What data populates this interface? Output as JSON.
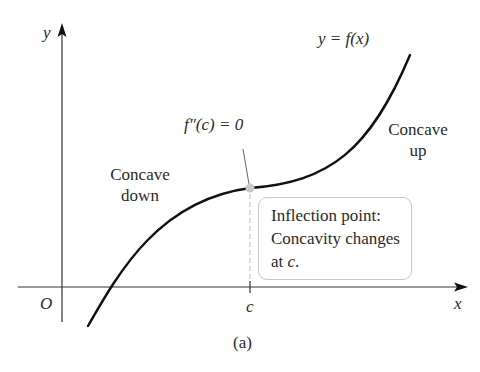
{
  "figure": {
    "axes": {
      "x_label": "x",
      "y_label": "y",
      "origin_label": "O",
      "tick_label_c": "c"
    },
    "curve_label": "y = f(x)",
    "annotations": {
      "second_derivative": "f″(c) = 0",
      "concave_down_line1": "Concave",
      "concave_down_line2": "down",
      "concave_up_line1": "Concave",
      "concave_up_line2": "up"
    },
    "callout_box": {
      "line1": "Inflection point:",
      "line2": "Concavity changes",
      "line3_prefix": "at ",
      "line3_var": "c",
      "line3_suffix": "."
    },
    "caption": "(a)",
    "colors": {
      "curve": "#111111",
      "axes": "#333333",
      "inflection_dot": "#c8c8c8",
      "dashed_guide": "#bdbdbd",
      "box_border": "#c8c8c8"
    }
  }
}
